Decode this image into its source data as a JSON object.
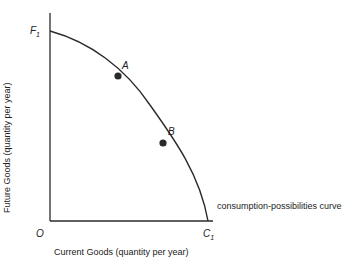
{
  "figure": {
    "y_axis_label": "Future Goods (quantity per year)",
    "x_axis_label": "Current Goods (quantity per year)",
    "origin_label": "O",
    "y_intercept_label": {
      "main": "F",
      "sub": "1"
    },
    "x_intercept_label": {
      "main": "C",
      "sub": "1"
    },
    "curve_label": "consumption-possibilities curve",
    "points": [
      {
        "label": "A"
      },
      {
        "label": "B"
      }
    ],
    "colors": {
      "line": "#2a2a2a",
      "point": "#2a2a2a",
      "background": "#ffffff"
    }
  }
}
